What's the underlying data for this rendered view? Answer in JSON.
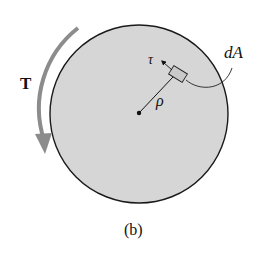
{
  "figure": {
    "caption": "(b)",
    "torque_label": "T",
    "shear_label": "τ",
    "radius_label": "ρ",
    "area_label": "dA"
  },
  "colors": {
    "disk_fill": "#d6d6d6",
    "disk_stroke": "#1a1a1a",
    "torque_arrow": "#8c8c8c",
    "element_fill": "#c9c9c9"
  }
}
